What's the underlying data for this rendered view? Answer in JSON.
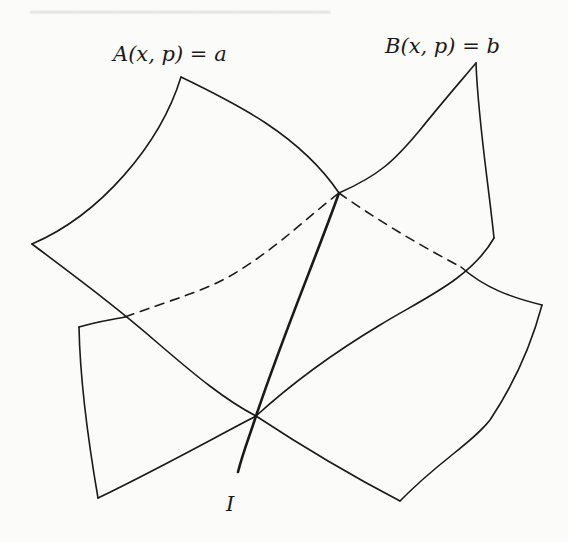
{
  "figure": {
    "labels": {
      "surface_a": "A(x, p) = a",
      "surface_b": "B(x, p) = b",
      "curve_i": "I"
    },
    "colors": {
      "stroke": "#1a1a1a",
      "background": "#fbfbfa"
    },
    "elements": [
      {
        "name": "surface-a",
        "kind": "curved quadrilateral sheet",
        "style": "solid"
      },
      {
        "name": "surface-b",
        "kind": "curved quadrilateral sheet",
        "style": "solid"
      },
      {
        "name": "intersection-curve-i",
        "kind": "thick curve",
        "style": "solid"
      },
      {
        "name": "hidden-edge-left",
        "kind": "occluded edge",
        "style": "dashed"
      },
      {
        "name": "hidden-edge-right",
        "kind": "occluded edge",
        "style": "dashed"
      }
    ]
  }
}
